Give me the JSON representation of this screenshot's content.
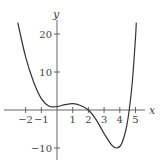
{
  "chart_data": {
    "type": "line",
    "title": "",
    "xlabel": "x",
    "ylabel": "y",
    "xlim": [
      -2.6,
      5.6
    ],
    "ylim": [
      -13,
      25
    ],
    "grid": false,
    "legend": null,
    "x_ticks": [
      -2,
      -1,
      1,
      2,
      3,
      4,
      5
    ],
    "x_tick_labels": [
      "−2",
      "−1",
      "1",
      "2",
      "3",
      "4",
      "5"
    ],
    "y_ticks": [
      20,
      10,
      -10
    ],
    "y_tick_labels": [
      "20",
      "10",
      "−10"
    ],
    "series": [
      {
        "name": "f(x)",
        "x": [
          -2.5,
          -2.0,
          -1.5,
          -1.0,
          -0.5,
          0.0,
          0.5,
          1.0,
          1.5,
          2.0,
          2.5,
          3.0,
          3.5,
          3.8,
          4.1,
          4.4,
          4.6,
          4.8,
          5.0,
          5.05
        ],
        "y": [
          23,
          14,
          7.5,
          3,
          1.0,
          0.9,
          1.4,
          1.7,
          1.2,
          0,
          -2.6,
          -6.2,
          -9.3,
          -10,
          -9.0,
          -5.0,
          0,
          7.5,
          19,
          23
        ]
      }
    ]
  },
  "colors": {
    "axis": "#555555",
    "curve": "#333333",
    "text": "#444444"
  }
}
